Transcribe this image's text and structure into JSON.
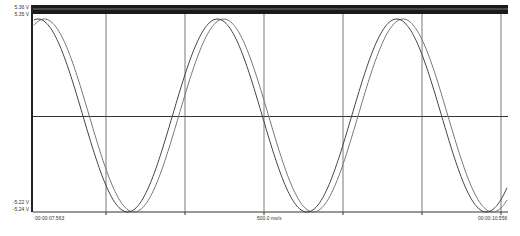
{
  "chart_data": {
    "type": "line",
    "title": "",
    "xlabel": "",
    "ylabel": "",
    "y_axis_labels": {
      "top_series_max": "5.36 V",
      "second_series_max": "5.35 V",
      "top_series_min": "-5.22 V",
      "second_series_min": "-5.24 V"
    },
    "x_axis_labels": {
      "start": "00:00:07.563",
      "division": "500.0 ms/s",
      "end": "00:00:10.556"
    },
    "ylim": [
      -5.24,
      5.36
    ],
    "grid": true,
    "x_divisions": 6,
    "series": [
      {
        "name": "Channel A",
        "type": "sine",
        "amplitude_v": 5.3,
        "period_divisions": 2.27,
        "phase_offset_divisions": 0.0,
        "color": "#444444"
      },
      {
        "name": "Channel B",
        "type": "sine",
        "amplitude_v": 5.3,
        "period_divisions": 2.27,
        "phase_offset_divisions": 0.08,
        "color": "#777777"
      },
      {
        "name": "Reference High 1",
        "type": "flat",
        "value_v": 5.36,
        "color": "#111111"
      },
      {
        "name": "Reference High 2",
        "type": "flat",
        "value_v": 5.35,
        "color": "#111111"
      }
    ]
  },
  "labels": {
    "y_top_1": "5.36 V",
    "y_top_2": "5.35 V",
    "y_bottom_1": "-5.22 V",
    "y_bottom_2": "-5.24 V",
    "x_start": "00:00:07.563",
    "x_mid": "500.0 ms/s",
    "x_end": "00:00:10.556"
  }
}
